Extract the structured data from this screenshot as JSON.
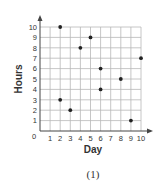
{
  "chart_data": {
    "type": "scatter",
    "title": "",
    "caption": "(1)",
    "xlabel": "Day",
    "ylabel": "Hours",
    "xlim": [
      0,
      10
    ],
    "ylim": [
      0,
      10
    ],
    "grid": true,
    "legend": null,
    "x_ticks": [
      "0",
      "1",
      "2",
      "3",
      "4",
      "5",
      "6",
      "7",
      "8",
      "9",
      "10"
    ],
    "y_ticks": [
      "0",
      "1",
      "2",
      "3",
      "4",
      "5",
      "6",
      "7",
      "8",
      "9",
      "10"
    ],
    "points": [
      {
        "x": 2,
        "y": 10
      },
      {
        "x": 2,
        "y": 3
      },
      {
        "x": 3,
        "y": 2
      },
      {
        "x": 4,
        "y": 8
      },
      {
        "x": 5,
        "y": 9
      },
      {
        "x": 6,
        "y": 6
      },
      {
        "x": 6,
        "y": 4
      },
      {
        "x": 8,
        "y": 5
      },
      {
        "x": 9,
        "y": 1
      },
      {
        "x": 10,
        "y": 7
      }
    ],
    "colors": {
      "point": "#222222",
      "grid": "#b8b8b8",
      "axis": "#444444"
    }
  }
}
